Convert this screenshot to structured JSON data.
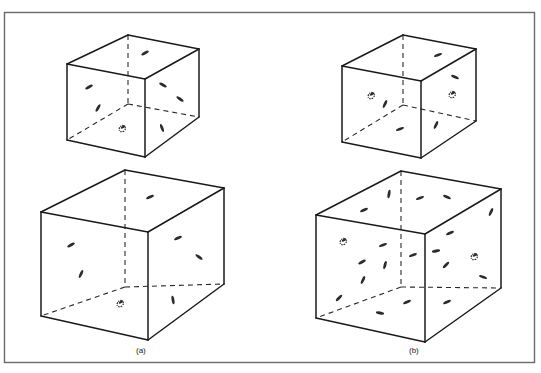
{
  "figure": {
    "panels": [
      {
        "id": "a",
        "label": "(a)"
      },
      {
        "id": "b",
        "label": "(b)"
      }
    ],
    "cubes": {
      "a_small": {
        "ftl": [
          67,
          64
        ],
        "btl": [
          128,
          35
        ],
        "btr": [
          199,
          49
        ],
        "ftr": [
          145,
          79
        ],
        "fbl": [
          67,
          140
        ],
        "fbr": [
          145,
          157
        ],
        "bbr": [
          199,
          117
        ],
        "bbl": [
          128,
          104
        ],
        "features": [
          [
            145,
            53,
            -30
          ],
          [
            89,
            87,
            -30
          ],
          [
            98,
            108,
            -60
          ],
          [
            163,
            85,
            30
          ],
          [
            180,
            99,
            35
          ],
          [
            162,
            128,
            70
          ]
        ],
        "spirals": [
          [
            123,
            127
          ]
        ]
      },
      "a_large": {
        "ftl": [
          41,
          212
        ],
        "btl": [
          125,
          170
        ],
        "btr": [
          224,
          188
        ],
        "ftr": [
          148,
          232
        ],
        "fbl": [
          41,
          316
        ],
        "fbr": [
          148,
          340
        ],
        "bbr": [
          224,
          284
        ],
        "bbl": [
          125,
          287
        ],
        "features": [
          [
            150,
            197,
            -25
          ],
          [
            71,
            245,
            -30
          ],
          [
            81,
            274,
            -65
          ],
          [
            178,
            238,
            -25
          ],
          [
            199,
            257,
            35
          ],
          [
            173,
            300,
            80
          ]
        ],
        "spirals": [
          [
            121,
            302
          ]
        ]
      },
      "b_small": {
        "ftl": [
          342,
          66
        ],
        "btl": [
          403,
          35
        ],
        "btr": [
          476,
          49
        ],
        "ftr": [
          421,
          81
        ],
        "fbl": [
          342,
          142
        ],
        "fbr": [
          421,
          158
        ],
        "bbr": [
          476,
          121
        ],
        "bbl": [
          403,
          105
        ],
        "features": [
          [
            438,
            55,
            -20
          ],
          [
            455,
            77,
            25
          ],
          [
            385,
            104,
            -65
          ],
          [
            400,
            129,
            -20
          ],
          [
            436,
            125,
            -65
          ]
        ],
        "spirals": [
          [
            372,
            94
          ],
          [
            453,
            93
          ]
        ]
      },
      "b_large": {
        "ftl": [
          316,
          215
        ],
        "btl": [
          401,
          171
        ],
        "btr": [
          501,
          189
        ],
        "ftr": [
          425,
          234
        ],
        "fbl": [
          316,
          318
        ],
        "fbr": [
          425,
          342
        ],
        "bbr": [
          501,
          288
        ],
        "bbl": [
          401,
          287
        ],
        "features": [
          [
            389,
            194,
            -80
          ],
          [
            364,
            210,
            -25
          ],
          [
            420,
            198,
            -20
          ],
          [
            447,
            197,
            25
          ],
          [
            491,
            212,
            -65
          ],
          [
            383,
            245,
            -20
          ],
          [
            450,
            233,
            -25
          ],
          [
            413,
            255,
            -20
          ],
          [
            436,
            251,
            -10
          ],
          [
            362,
            262,
            -30
          ],
          [
            385,
            265,
            -75
          ],
          [
            363,
            280,
            -65
          ],
          [
            446,
            265,
            -45
          ],
          [
            483,
            277,
            20
          ],
          [
            339,
            298,
            -45
          ],
          [
            407,
            302,
            -25
          ],
          [
            380,
            313,
            10
          ],
          [
            447,
            302,
            -25
          ]
        ],
        "spirals": [
          [
            344,
            240
          ],
          [
            475,
            255
          ]
        ]
      }
    }
  }
}
